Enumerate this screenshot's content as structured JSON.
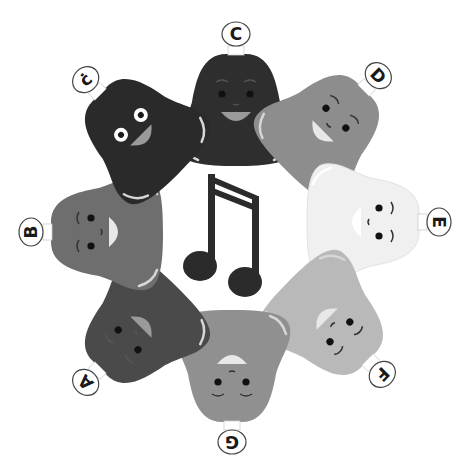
{
  "scene": {
    "title": "Bell choir ring",
    "background": "#ffffff",
    "center_icon": "beamed-eighth-notes-icon",
    "note_color": "#2b2b2b"
  },
  "bells": [
    {
      "id": "c-low",
      "label": "C",
      "color": "#2e2e2e",
      "angle": 0,
      "cx": 236,
      "cy": 108
    },
    {
      "id": "d",
      "label": "D",
      "color": "#8d8d8d",
      "angle": 45,
      "cx": 326,
      "cy": 128
    },
    {
      "id": "e",
      "label": "E",
      "color": "#f0f0f0",
      "angle": 90,
      "cx": 365,
      "cy": 222
    },
    {
      "id": "f",
      "label": "F",
      "color": "#b9b9b9",
      "angle": 135,
      "cx": 330,
      "cy": 322
    },
    {
      "id": "g",
      "label": "G",
      "color": "#909090",
      "angle": 180,
      "cx": 232,
      "cy": 368
    },
    {
      "id": "a",
      "label": "A",
      "color": "#4a4a4a",
      "angle": -135,
      "cx": 138,
      "cy": 330
    },
    {
      "id": "b",
      "label": "B",
      "color": "#6e6e6e",
      "angle": -90,
      "cx": 105,
      "cy": 232
    },
    {
      "id": "c-high",
      "label": "Ċ",
      "display_label": "ċ",
      "color": "#2a2a2a",
      "angle": -45,
      "cx": 138,
      "cy": 132
    }
  ]
}
